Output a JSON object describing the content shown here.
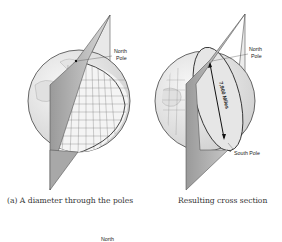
{
  "figure": {
    "left": {
      "north_label_line1": "North",
      "north_label_line2": "Pole",
      "caption": "(a) A diameter through the poles"
    },
    "right": {
      "north_label_line1": "North",
      "north_label_line2": "Pole",
      "south_label": "South Pole",
      "diameter_label": "7,900 Miles",
      "caption": "Resulting cross section"
    },
    "bottom_partial_label": "North"
  }
}
